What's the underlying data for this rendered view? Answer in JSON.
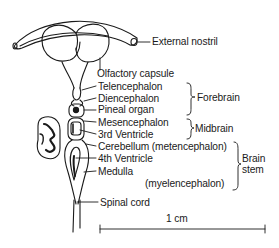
{
  "diagram": {
    "type": "anatomical-illustration",
    "structure_labels": [
      {
        "id": "external-nostril",
        "text": "External nostril"
      },
      {
        "id": "olfactory-capsule",
        "text": "Olfactory capsule"
      },
      {
        "id": "telencephalon",
        "text": "Telencephalon"
      },
      {
        "id": "diencephalon",
        "text": "Diencephalon"
      },
      {
        "id": "pineal-organ",
        "text": "Pineal organ"
      },
      {
        "id": "mesencephalon",
        "text": "Mesencephalon"
      },
      {
        "id": "third-ventricle",
        "text": "3rd Ventricle"
      },
      {
        "id": "cerebellum",
        "text": "Cerebellum (metencephalon)"
      },
      {
        "id": "fourth-ventricle",
        "text": "4th Ventricle"
      },
      {
        "id": "medulla",
        "text": "Medulla"
      },
      {
        "id": "myelencephalon",
        "text": "(myelencephalon)"
      },
      {
        "id": "spinal-cord",
        "text": "Spinal cord"
      }
    ],
    "group_labels": [
      {
        "id": "forebrain",
        "text": "Forebrain",
        "spans": [
          "Telencephalon",
          "Diencephalon",
          "Pineal organ"
        ]
      },
      {
        "id": "midbrain",
        "text": "Midbrain",
        "spans": [
          "Mesencephalon",
          "3rd Ventricle"
        ]
      },
      {
        "id": "brain-stem",
        "line1": "Brain",
        "line2": "stem",
        "spans": [
          "Cerebellum (metencephalon)",
          "4th Ventricle",
          "Medulla",
          "(myelencephalon)"
        ]
      }
    ],
    "scale_bar": {
      "label": "1 cm"
    }
  }
}
